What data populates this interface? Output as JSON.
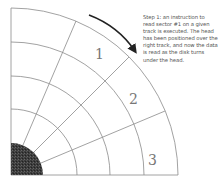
{
  "caption": {
    "lines": [
      "Step 1:  an instruction to",
      "read sector #1 on a given",
      "track is executed.  The head",
      "has been positioned over the",
      "right track, and now the data",
      "is read as the disk turns",
      "under the head."
    ]
  },
  "sectors": [
    {
      "label": "1"
    },
    {
      "label": "2"
    },
    {
      "label": "3"
    }
  ],
  "colors": {
    "lines": "#8a8a8a",
    "hub": "#3a3a3a",
    "arrow": "#222222"
  }
}
